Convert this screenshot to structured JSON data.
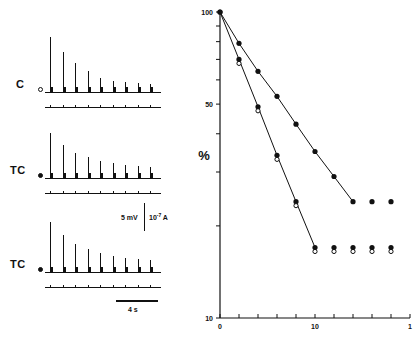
{
  "figure": {
    "caption_present": false
  },
  "traces": {
    "panels": [
      {
        "label": "C",
        "marker": "open-circle",
        "baseline_y": 92,
        "stim_y": 107,
        "spike_heights": [
          55,
          40,
          29,
          21,
          14,
          11,
          10,
          9,
          8
        ],
        "n_spikes": 9
      },
      {
        "label": "TC",
        "marker": "filled-circle",
        "baseline_y": 178,
        "stim_y": 193,
        "spike_heights": [
          45,
          33,
          25,
          21,
          17,
          15,
          13,
          12,
          11
        ],
        "n_spikes": 9
      },
      {
        "label": "TC",
        "marker": "filled-circle",
        "baseline_y": 272,
        "stim_y": 287,
        "spike_heights": [
          50,
          37,
          28,
          23,
          19,
          16,
          14,
          13,
          12
        ],
        "n_spikes": 9
      }
    ],
    "scale_vertical": {
      "voltage": "5 mV",
      "current_mantissa": "10",
      "current_exponent": "-7",
      "current_unit": "A"
    },
    "scale_time": {
      "label": "4 s"
    }
  },
  "chart_data": {
    "type": "scatter",
    "title": "",
    "xlabel": "",
    "ylabel": "%",
    "y_scale": "log",
    "ylim": [
      10,
      100
    ],
    "y_ticks": [
      100,
      50,
      10
    ],
    "y_tick_labels": [
      "100",
      "50",
      "10"
    ],
    "xlim": [
      0,
      20
    ],
    "x_ticks": [
      0,
      2,
      4,
      6,
      8,
      10,
      12,
      14,
      16,
      18,
      20
    ],
    "x_tick_labels_shown": {
      "0": "0",
      "10": "10",
      "20": "1"
    },
    "grid": false,
    "legend": null,
    "series": [
      {
        "name": "upper-series",
        "marker": "filled-circle",
        "connected": true,
        "x": [
          0,
          2,
          4,
          6,
          8,
          10,
          12,
          14,
          16,
          18
        ],
        "y": [
          100,
          79,
          64,
          53,
          43,
          35,
          29,
          24,
          24,
          24
        ]
      },
      {
        "name": "lower-series",
        "marker": "filled-and-open-circle",
        "connected": true,
        "x": [
          0,
          2,
          4,
          6,
          8,
          10,
          12,
          14,
          16,
          18
        ],
        "y": [
          100,
          70,
          49,
          34,
          24,
          17,
          17,
          17,
          17,
          17
        ]
      }
    ]
  }
}
